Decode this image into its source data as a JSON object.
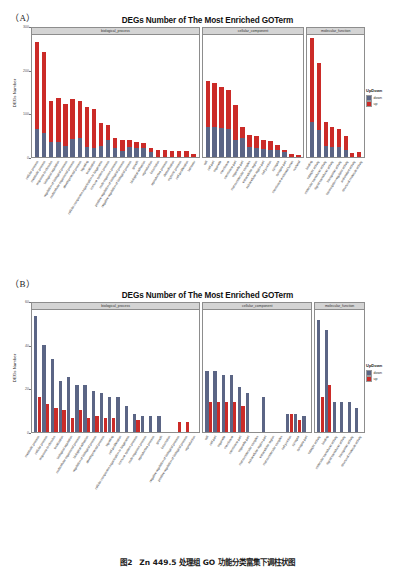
{
  "figure_a": {
    "letter": "（A）",
    "title": "DEGs Number of The Most Enriched GOTerm",
    "ylabel": "DEGs Number",
    "legend": {
      "title": "UpDown",
      "items": [
        {
          "label": "down",
          "color": "#5b6585"
        },
        {
          "label": "up",
          "color": "#cb2b28"
        }
      ]
    }
  },
  "figure_b": {
    "letter": "（B）",
    "title": "DEGs Number of The Most Enriched GOTerm",
    "ylabel": "DEGs Number",
    "legend": {
      "title": "UpDown",
      "items": [
        {
          "label": "down",
          "color": "#5b6585"
        },
        {
          "label": "up",
          "color": "#cb2b28"
        }
      ]
    }
  },
  "caption": "图2　Zn 449.5 处理组 GO 功能分类富集下调柱状图",
  "chart_data": [
    {
      "type": "bar",
      "id": "panel-a",
      "title": "DEGs Number of The Most Enriched GOTerm",
      "subtitle": "(A)",
      "xlabel": "",
      "ylabel": "DEGs Number",
      "ylim": [
        0,
        300
      ],
      "yticks": [
        0,
        100,
        200,
        300
      ],
      "grid": false,
      "bar_mode": "stacked",
      "legend": {
        "title": "UpDown",
        "position": "right",
        "entries": [
          "down",
          "up"
        ]
      },
      "facets": [
        {
          "name": "biological_process",
          "categories": [
            "cellular process",
            "metabolic process",
            "response to stimulus",
            "biological regulation",
            "regulation of biological process",
            "multicellular organismal process",
            "developmental process",
            "signaling",
            "localization",
            "cellular component organization or biogenesis",
            "immune system process",
            "multi-organism process",
            "positive regulation of biological process",
            "negative regulation of biological process",
            "growth",
            "biological adhesion",
            "reproduction",
            "locomotion",
            "reproductive process",
            "detoxification",
            "rhythmic process",
            "cell proliferation",
            "behavior"
          ],
          "series": [
            {
              "name": "down",
              "values": [
                68,
                60,
                36,
                38,
                28,
                45,
                46,
                24,
                22,
                26,
                41,
                23,
                16,
                25,
                23,
                21,
                12,
                0,
                0,
                0,
                0,
                0,
                0
              ]
            },
            {
              "name": "up",
              "values": [
                214,
                198,
                102,
                106,
                103,
                97,
                91,
                100,
                96,
                57,
                38,
                23,
                25,
                16,
                13,
                13,
                11,
                18,
                17,
                15,
                14,
                14,
                8
              ]
            }
          ]
        },
        {
          "name": "cellular_component",
          "categories": [
            "cell",
            "cell part",
            "organelle",
            "membrane",
            "membrane part",
            "organelle part",
            "macromolecular complex",
            "extracellular region",
            "extracellular region part",
            "cell junction",
            "synapse",
            "synapse part",
            "membrane-enclosed lumen",
            "nucleoid"
          ],
          "series": [
            {
              "name": "down",
              "values": [
                74,
                73,
                71,
                70,
                42,
                48,
                24,
                21,
                20,
                17,
                17,
                12,
                0,
                0
              ]
            },
            {
              "name": "up",
              "values": [
                113,
                110,
                101,
                95,
                87,
                25,
                29,
                30,
                23,
                23,
                13,
                5,
                8,
                4
              ]
            }
          ]
        },
        {
          "name": "molecular_function",
          "categories": [
            "binding",
            "catalytic activity",
            "molecular transducer activity",
            "signal transducer activity",
            "transporter activity",
            "transcription regulator activity",
            "antioxidant activity",
            "structural molecule activity"
          ],
          "series": [
            {
              "name": "down",
              "values": [
                86,
                66,
                28,
                24,
                25,
                18,
                0,
                0
              ]
            },
            {
              "name": "up",
              "values": [
                207,
                164,
                58,
                49,
                44,
                33,
                9,
                12
              ]
            }
          ]
        }
      ]
    },
    {
      "type": "bar",
      "id": "panel-b",
      "title": "DEGs Number of The Most Enriched GOTerm",
      "subtitle": "(B)",
      "xlabel": "",
      "ylabel": "DEGs Number",
      "ylim": [
        0,
        60
      ],
      "yticks": [
        0,
        20,
        40,
        60
      ],
      "grid": false,
      "bar_mode": "dodged",
      "legend": {
        "title": "UpDown",
        "position": "right",
        "entries": [
          "down",
          "up"
        ]
      },
      "facets": [
        {
          "name": "biological_process",
          "categories": [
            "metabolic process",
            "cellular process",
            "response to stimulus",
            "localization",
            "biological regulation",
            "multicellular organismal process",
            "biological adhesion",
            "regulation of biological process",
            "developmental process",
            "signaling",
            "cell proliferation",
            "cellular component organization or biogenesis",
            "immune system process",
            "multi-organism process",
            "reproductive process",
            "growth",
            "locomotion",
            "negative regulation of biological process",
            "positive regulation of biological process",
            "reproduction"
          ],
          "series": [
            {
              "name": "down",
              "values": [
                57,
                43,
                36,
                25,
                27,
                23,
                23,
                20,
                19,
                17,
                17,
                13,
                9,
                8,
                8,
                8,
                0,
                0,
                0,
                0
              ]
            },
            {
              "name": "up",
              "values": [
                17,
                14,
                12,
                11,
                7,
                11,
                7,
                8,
                7,
                7,
                0,
                0,
                6,
                0,
                0,
                0,
                0,
                5,
                5,
                0
              ]
            }
          ]
        },
        {
          "name": "cellular_component",
          "categories": [
            "cell",
            "cell part",
            "organelle",
            "membrane",
            "membrane part",
            "organelle part",
            "macromolecular complex",
            "extracellular region part",
            "extracellular region",
            "macromolecular complex",
            "cell junction",
            "synapse",
            "synapse part"
          ],
          "series": [
            {
              "name": "down",
              "values": [
                30,
                30,
                28,
                28,
                22,
                19,
                0,
                17,
                0,
                0,
                9,
                9,
                8
              ]
            },
            {
              "name": "up",
              "values": [
                15,
                15,
                15,
                15,
                13,
                0,
                0,
                0,
                0,
                0,
                9,
                6,
                0
              ]
            }
          ]
        },
        {
          "name": "molecular_function",
          "categories": [
            "catalytic activity",
            "binding",
            "molecular transducer activity",
            "signal transducer activity",
            "transporter activity",
            "structural molecule activity"
          ],
          "series": [
            {
              "name": "down",
              "values": [
                55,
                50,
                15,
                15,
                15,
                12
              ]
            },
            {
              "name": "up",
              "values": [
                17,
                23,
                0,
                0,
                0,
                0
              ]
            }
          ]
        }
      ]
    }
  ]
}
